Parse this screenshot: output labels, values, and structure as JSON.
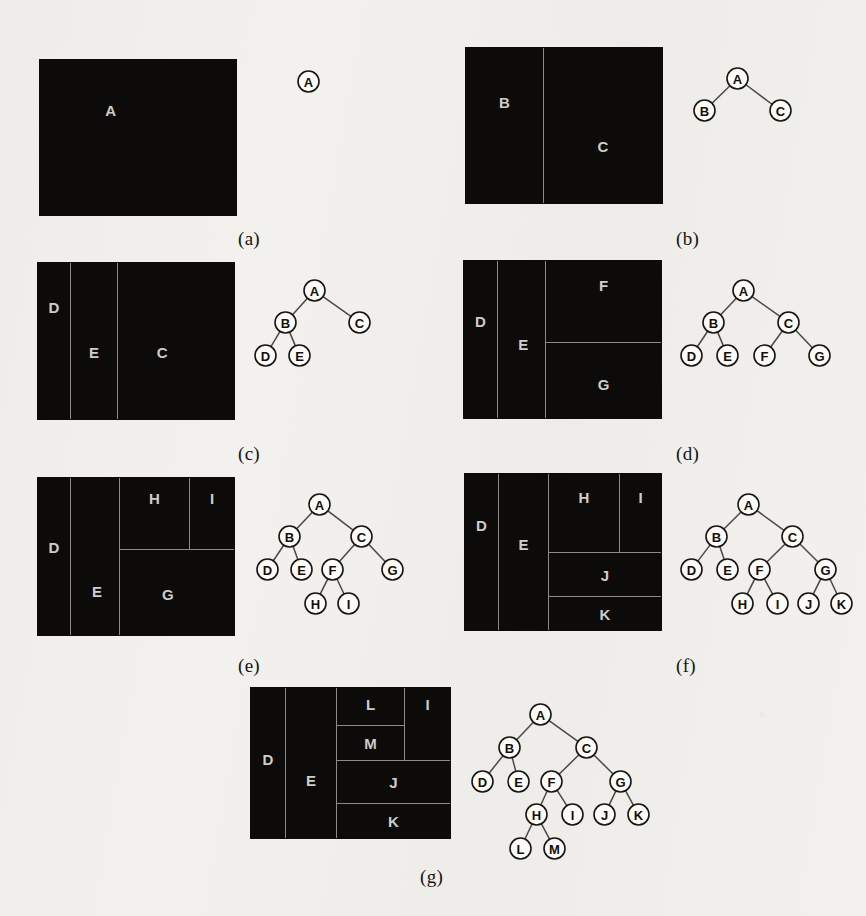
{
  "figure": {
    "background_color": "#f3f1ee",
    "fill_color": "#0c0b09",
    "divider_color": "#8d8a82",
    "cell_label_color": "#cfcdc6",
    "node_fill": "#fcfbf8",
    "node_stroke": "#161512",
    "edge_color": "#4a4844"
  },
  "panels": [
    {
      "id": "a",
      "caption": "(a)",
      "caption_pos": {
        "x": 238,
        "y": 228
      },
      "rect": {
        "x": 40,
        "y": 60,
        "w": 196,
        "h": 155
      },
      "cells": [
        {
          "label": "A",
          "x": 0,
          "y": 0,
          "w": 196,
          "h": 155,
          "lx": 0.36,
          "ly": 0.32,
          "borders": ""
        }
      ],
      "tree": {
        "origin": {
          "x": 276,
          "y": 50
        },
        "nodes": [
          {
            "id": "A",
            "x": 22,
            "y": 21
          }
        ],
        "edges": []
      }
    },
    {
      "id": "b",
      "caption": "(b)",
      "caption_pos": {
        "x": 676,
        "y": 228
      },
      "rect": {
        "x": 466,
        "y": 48,
        "w": 196,
        "h": 155
      },
      "cells": [
        {
          "label": "B",
          "x": 0,
          "y": 0,
          "w": 78,
          "h": 155,
          "lx": 0.5,
          "ly": 0.35,
          "borders": "vline"
        },
        {
          "label": "C",
          "x": 78,
          "y": 0,
          "w": 118,
          "h": 155,
          "lx": 0.5,
          "ly": 0.63,
          "borders": ""
        }
      ],
      "tree": {
        "origin": {
          "x": 676,
          "y": 50
        },
        "nodes": [
          {
            "id": "A",
            "x": 51,
            "y": 18
          },
          {
            "id": "B",
            "x": 18,
            "y": 50
          },
          {
            "id": "C",
            "x": 94,
            "y": 50
          }
        ],
        "edges": [
          [
            "A",
            "B"
          ],
          [
            "A",
            "C"
          ]
        ]
      }
    },
    {
      "id": "c",
      "caption": "(c)",
      "caption_pos": {
        "x": 238,
        "y": 443
      },
      "rect": {
        "x": 38,
        "y": 263,
        "w": 196,
        "h": 156
      },
      "cells": [
        {
          "label": "D",
          "x": 0,
          "y": 0,
          "w": 33,
          "h": 156,
          "lx": 0.5,
          "ly": 0.28,
          "borders": "vline"
        },
        {
          "label": "E",
          "x": 33,
          "y": 0,
          "w": 47,
          "h": 156,
          "lx": 0.5,
          "ly": 0.57,
          "borders": "vline"
        },
        {
          "label": "C",
          "x": 80,
          "y": 0,
          "w": 116,
          "h": 156,
          "lx": 0.38,
          "ly": 0.57,
          "borders": ""
        }
      ],
      "tree": {
        "origin": {
          "x": 252,
          "y": 262
        },
        "nodes": [
          {
            "id": "A",
            "x": 52,
            "y": 18
          },
          {
            "id": "B",
            "x": 23,
            "y": 50
          },
          {
            "id": "C",
            "x": 97,
            "y": 50
          },
          {
            "id": "D",
            "x": 3,
            "y": 83
          },
          {
            "id": "E",
            "x": 37,
            "y": 83
          }
        ],
        "edges": [
          [
            "A",
            "B"
          ],
          [
            "A",
            "C"
          ],
          [
            "B",
            "D"
          ],
          [
            "B",
            "E"
          ]
        ]
      }
    },
    {
      "id": "d",
      "caption": "(d)",
      "caption_pos": {
        "x": 676,
        "y": 443
      },
      "rect": {
        "x": 464,
        "y": 261,
        "w": 197,
        "h": 157
      },
      "cells": [
        {
          "label": "D",
          "x": 0,
          "y": 0,
          "w": 34,
          "h": 157,
          "lx": 0.5,
          "ly": 0.38,
          "borders": "vline"
        },
        {
          "label": "E",
          "x": 34,
          "y": 0,
          "w": 48,
          "h": 157,
          "lx": 0.54,
          "ly": 0.53,
          "borders": "vline"
        },
        {
          "label": "F",
          "x": 82,
          "y": 0,
          "w": 115,
          "h": 82,
          "lx": 0.5,
          "ly": 0.3,
          "borders": "hline"
        },
        {
          "label": "G",
          "x": 82,
          "y": 82,
          "w": 115,
          "h": 75,
          "lx": 0.5,
          "ly": 0.55,
          "borders": ""
        }
      ],
      "tree": {
        "origin": {
          "x": 676,
          "y": 262
        },
        "nodes": [
          {
            "id": "A",
            "x": 57,
            "y": 18
          },
          {
            "id": "B",
            "x": 27,
            "y": 50
          },
          {
            "id": "C",
            "x": 102,
            "y": 50
          },
          {
            "id": "D",
            "x": 5,
            "y": 83
          },
          {
            "id": "E",
            "x": 41,
            "y": 83
          },
          {
            "id": "F",
            "x": 78,
            "y": 83
          },
          {
            "id": "G",
            "x": 133,
            "y": 83
          }
        ],
        "edges": [
          [
            "A",
            "B"
          ],
          [
            "A",
            "C"
          ],
          [
            "B",
            "D"
          ],
          [
            "B",
            "E"
          ],
          [
            "C",
            "F"
          ],
          [
            "C",
            "G"
          ]
        ]
      }
    },
    {
      "id": "e",
      "caption": "(e)",
      "caption_pos": {
        "x": 238,
        "y": 655
      },
      "rect": {
        "x": 38,
        "y": 478,
        "w": 196,
        "h": 157
      },
      "cells": [
        {
          "label": "D",
          "x": 0,
          "y": 0,
          "w": 33,
          "h": 157,
          "lx": 0.5,
          "ly": 0.44,
          "borders": "vline"
        },
        {
          "label": "E",
          "x": 33,
          "y": 0,
          "w": 49,
          "h": 157,
          "lx": 0.54,
          "ly": 0.72,
          "borders": "vline"
        },
        {
          "label": "H",
          "x": 82,
          "y": 0,
          "w": 70,
          "h": 72,
          "lx": 0.5,
          "ly": 0.28,
          "borders": "vline hline"
        },
        {
          "label": "I",
          "x": 152,
          "y": 0,
          "w": 44,
          "h": 72,
          "lx": 0.5,
          "ly": 0.28,
          "borders": "hline"
        },
        {
          "label": "G",
          "x": 82,
          "y": 72,
          "w": 114,
          "h": 85,
          "lx": 0.42,
          "ly": 0.52,
          "borders": ""
        }
      ],
      "tree": {
        "origin": {
          "x": 252,
          "y": 476
        },
        "nodes": [
          {
            "id": "A",
            "x": 57,
            "y": 18
          },
          {
            "id": "B",
            "x": 27,
            "y": 50
          },
          {
            "id": "C",
            "x": 99,
            "y": 50
          },
          {
            "id": "D",
            "x": 5,
            "y": 83
          },
          {
            "id": "E",
            "x": 39,
            "y": 83
          },
          {
            "id": "F",
            "x": 70,
            "y": 83
          },
          {
            "id": "G",
            "x": 130,
            "y": 83
          },
          {
            "id": "H",
            "x": 53,
            "y": 117
          },
          {
            "id": "I",
            "x": 86,
            "y": 117
          }
        ],
        "edges": [
          [
            "A",
            "B"
          ],
          [
            "A",
            "C"
          ],
          [
            "B",
            "D"
          ],
          [
            "B",
            "E"
          ],
          [
            "C",
            "F"
          ],
          [
            "C",
            "G"
          ],
          [
            "F",
            "H"
          ],
          [
            "F",
            "I"
          ]
        ]
      }
    },
    {
      "id": "f",
      "caption": "(f)",
      "caption_pos": {
        "x": 676,
        "y": 655
      },
      "rect": {
        "x": 465,
        "y": 474,
        "w": 196,
        "h": 156
      },
      "cells": [
        {
          "label": "D",
          "x": 0,
          "y": 0,
          "w": 34,
          "h": 156,
          "lx": 0.5,
          "ly": 0.33,
          "borders": "vline"
        },
        {
          "label": "E",
          "x": 34,
          "y": 0,
          "w": 50,
          "h": 156,
          "lx": 0.5,
          "ly": 0.45,
          "borders": "vline"
        },
        {
          "label": "H",
          "x": 84,
          "y": 0,
          "w": 71,
          "h": 79,
          "lx": 0.5,
          "ly": 0.3,
          "borders": "vline hline"
        },
        {
          "label": "I",
          "x": 155,
          "y": 0,
          "w": 41,
          "h": 79,
          "lx": 0.5,
          "ly": 0.3,
          "borders": "hline"
        },
        {
          "label": "J",
          "x": 84,
          "y": 79,
          "w": 112,
          "h": 44,
          "lx": 0.5,
          "ly": 0.5,
          "borders": "hline"
        },
        {
          "label": "K",
          "x": 84,
          "y": 123,
          "w": 112,
          "h": 33,
          "lx": 0.5,
          "ly": 0.5,
          "borders": ""
        }
      ],
      "tree": {
        "origin": {
          "x": 676,
          "y": 476
        },
        "nodes": [
          {
            "id": "A",
            "x": 62,
            "y": 18
          },
          {
            "id": "B",
            "x": 30,
            "y": 50
          },
          {
            "id": "C",
            "x": 106,
            "y": 50
          },
          {
            "id": "D",
            "x": 5,
            "y": 83
          },
          {
            "id": "E",
            "x": 41,
            "y": 83
          },
          {
            "id": "F",
            "x": 73,
            "y": 83
          },
          {
            "id": "G",
            "x": 139,
            "y": 83
          },
          {
            "id": "H",
            "x": 56,
            "y": 117
          },
          {
            "id": "I",
            "x": 91,
            "y": 117
          },
          {
            "id": "J",
            "x": 122,
            "y": 117
          },
          {
            "id": "K",
            "x": 155,
            "y": 117
          }
        ],
        "edges": [
          [
            "A",
            "B"
          ],
          [
            "A",
            "C"
          ],
          [
            "B",
            "D"
          ],
          [
            "B",
            "E"
          ],
          [
            "C",
            "F"
          ],
          [
            "C",
            "G"
          ],
          [
            "F",
            "H"
          ],
          [
            "F",
            "I"
          ],
          [
            "G",
            "J"
          ],
          [
            "G",
            "K"
          ]
        ]
      }
    },
    {
      "id": "g",
      "caption": "(g)",
      "caption_pos": {
        "x": 420,
        "y": 866
      },
      "rect": {
        "x": 251,
        "y": 688,
        "w": 199,
        "h": 150
      },
      "cells": [
        {
          "label": "D",
          "x": 0,
          "y": 0,
          "w": 35,
          "h": 150,
          "lx": 0.5,
          "ly": 0.47,
          "borders": "vline"
        },
        {
          "label": "E",
          "x": 35,
          "y": 0,
          "w": 51,
          "h": 150,
          "lx": 0.5,
          "ly": 0.61,
          "borders": "vline"
        },
        {
          "label": "L",
          "x": 86,
          "y": 0,
          "w": 68,
          "h": 38,
          "lx": 0.5,
          "ly": 0.42,
          "borders": "vline hline"
        },
        {
          "label": "M",
          "x": 86,
          "y": 38,
          "w": 68,
          "h": 35,
          "lx": 0.5,
          "ly": 0.5,
          "borders": "vline hline"
        },
        {
          "label": "I",
          "x": 154,
          "y": 0,
          "w": 45,
          "h": 73,
          "lx": 0.5,
          "ly": 0.22,
          "borders": "hline"
        },
        {
          "label": "J",
          "x": 86,
          "y": 73,
          "w": 113,
          "h": 43,
          "lx": 0.5,
          "ly": 0.5,
          "borders": "hline"
        },
        {
          "label": "K",
          "x": 86,
          "y": 116,
          "w": 113,
          "h": 34,
          "lx": 0.5,
          "ly": 0.5,
          "borders": ""
        }
      ],
      "tree": {
        "origin": {
          "x": 468,
          "y": 686
        },
        "nodes": [
          {
            "id": "A",
            "x": 62,
            "y": 18
          },
          {
            "id": "B",
            "x": 31,
            "y": 51
          },
          {
            "id": "C",
            "x": 108,
            "y": 51
          },
          {
            "id": "D",
            "x": 4,
            "y": 85
          },
          {
            "id": "E",
            "x": 40,
            "y": 85
          },
          {
            "id": "F",
            "x": 73,
            "y": 85
          },
          {
            "id": "G",
            "x": 142,
            "y": 85
          },
          {
            "id": "H",
            "x": 58,
            "y": 118
          },
          {
            "id": "I",
            "x": 94,
            "y": 118
          },
          {
            "id": "J",
            "x": 126,
            "y": 118
          },
          {
            "id": "K",
            "x": 160,
            "y": 118
          },
          {
            "id": "L",
            "x": 42,
            "y": 152
          },
          {
            "id": "M",
            "x": 76,
            "y": 152
          }
        ],
        "edges": [
          [
            "A",
            "B"
          ],
          [
            "A",
            "C"
          ],
          [
            "B",
            "D"
          ],
          [
            "B",
            "E"
          ],
          [
            "C",
            "F"
          ],
          [
            "C",
            "G"
          ],
          [
            "F",
            "H"
          ],
          [
            "F",
            "I"
          ],
          [
            "G",
            "J"
          ],
          [
            "G",
            "K"
          ],
          [
            "H",
            "L"
          ],
          [
            "H",
            "M"
          ]
        ]
      }
    }
  ]
}
